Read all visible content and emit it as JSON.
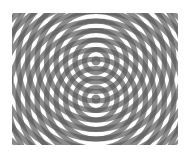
{
  "image": {
    "description": "Two-source circular wave interference pattern (moire of concentric rings)",
    "colors": {
      "background": "#ffffff",
      "ring": "#5a5a5a",
      "dark": "#3c3c3c"
    },
    "sources": [
      {
        "x": 96,
        "y": 61
      },
      {
        "x": 96,
        "y": 99
      }
    ],
    "ring_spacing": 9.5,
    "bounds": {
      "x": 12,
      "y": 13,
      "width": 166,
      "height": 132
    }
  }
}
